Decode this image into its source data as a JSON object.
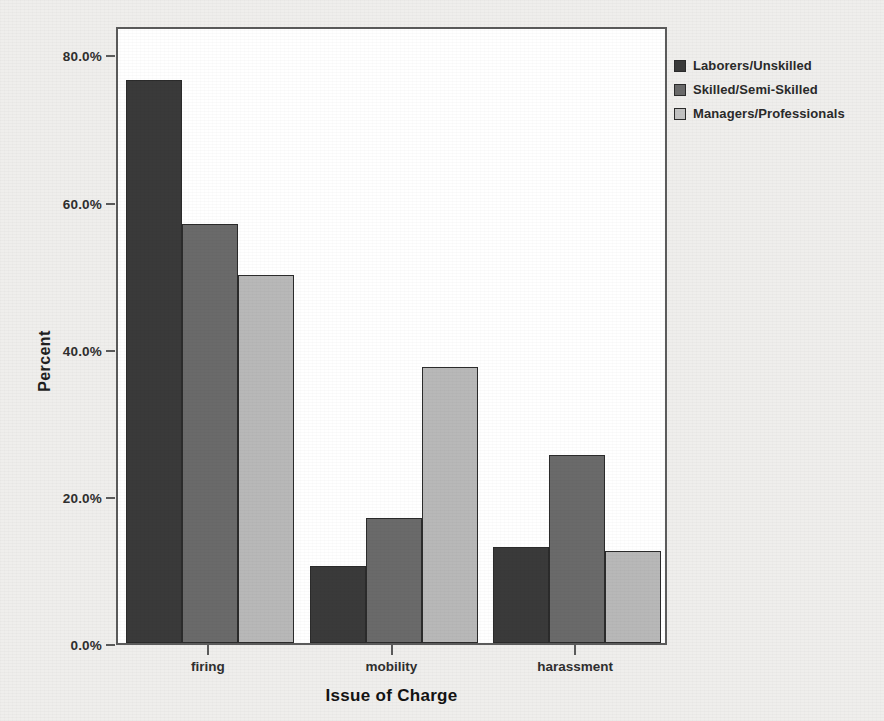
{
  "chart_data": {
    "type": "bar",
    "title": "",
    "xlabel": "Issue of Charge",
    "ylabel": "Percent",
    "categories": [
      "firing",
      "mobility",
      "harassment"
    ],
    "series": [
      {
        "name": "Laborers/Unskilled",
        "color": "#3a3a3a",
        "values": [
          76.5,
          10.5,
          13.0
        ]
      },
      {
        "name": "Skilled/Semi-Skilled",
        "color": "#6a6a6a",
        "values": [
          57.0,
          17.0,
          25.5
        ]
      },
      {
        "name": "Managers/Professionals",
        "color": "#b8b8b8",
        "values": [
          50.0,
          37.5,
          12.5
        ]
      }
    ],
    "ylim": [
      0,
      84
    ],
    "yticks": [
      0,
      20,
      40,
      60,
      80
    ],
    "ytick_labels": [
      "0.0%",
      "20.0%",
      "40.0%",
      "60.0%",
      "80.0%"
    ],
    "grid": false,
    "legend_position": "right-top",
    "plot_background": "#ffffff",
    "page_background": "#efeeec",
    "axis_color": "#5b5b5b"
  },
  "legend": {
    "entries": [
      {
        "label": "Laborers/Unskilled"
      },
      {
        "label": "Skilled/Semi-Skilled"
      },
      {
        "label": "Managers/Professionals"
      }
    ]
  }
}
